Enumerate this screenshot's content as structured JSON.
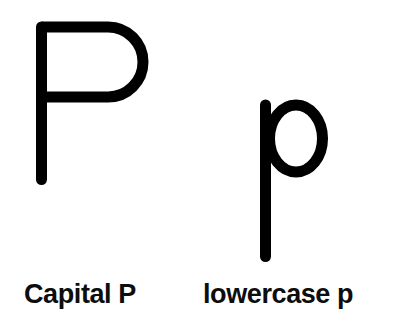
{
  "page": {
    "name": "letter-p-worksheet",
    "background_color": "#ffffff",
    "ink_color": "#000000",
    "width": 403,
    "height": 329
  },
  "letters": [
    {
      "id": "capital-p",
      "character": "P",
      "case": "uppercase",
      "caption": "Capital P",
      "stroke_width": 11,
      "stroke_color": "#000000",
      "bounds": {
        "x": 36,
        "y": 22,
        "width": 111,
        "height": 163
      }
    },
    {
      "id": "lowercase-p",
      "character": "p",
      "case": "lowercase",
      "caption": "lowercase p",
      "stroke_width": 11,
      "stroke_color": "#000000",
      "bounds": {
        "x": 260,
        "y": 100,
        "width": 68,
        "height": 162
      }
    }
  ],
  "captions": {
    "capital": "Capital P",
    "lowercase": "lowercase p"
  }
}
